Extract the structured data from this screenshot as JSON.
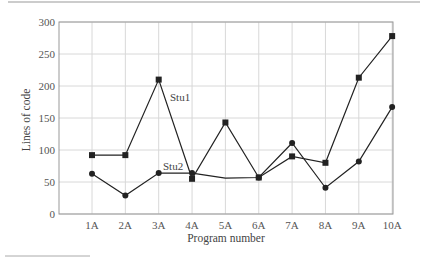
{
  "chart_data": {
    "type": "line",
    "title": "",
    "xlabel": "Program number",
    "ylabel": "Lines of code",
    "ylim": [
      0,
      300
    ],
    "yticks": [
      0,
      50,
      100,
      150,
      200,
      250,
      300
    ],
    "grid": true,
    "legend": "inline labels",
    "categories": [
      "1A",
      "2A",
      "3A",
      "4A",
      "5A",
      "6A",
      "7A",
      "8A",
      "9A",
      "10A"
    ],
    "series": [
      {
        "name": "Stu1",
        "marker": "square",
        "markers_shown": [
          true,
          true,
          true,
          true,
          true,
          true,
          true,
          true,
          true,
          true
        ],
        "values": [
          92,
          92,
          210,
          55,
          143,
          57,
          90,
          80,
          213,
          278
        ]
      },
      {
        "name": "Stu2",
        "marker": "circle",
        "markers_shown": [
          true,
          true,
          true,
          true,
          false,
          true,
          true,
          true,
          true,
          true
        ],
        "values": [
          63,
          29,
          64,
          64,
          56,
          57,
          111,
          41,
          82,
          167
        ]
      }
    ],
    "annotations": [
      {
        "text": "Stu1",
        "near": "3A-4A segment of Stu1"
      },
      {
        "text": "Stu2",
        "near": "3A-4A segment of Stu2"
      }
    ]
  },
  "colors": {
    "line": "#222222",
    "grid": "#d8d8d8",
    "axis": "#888888",
    "rule": "#999999"
  }
}
